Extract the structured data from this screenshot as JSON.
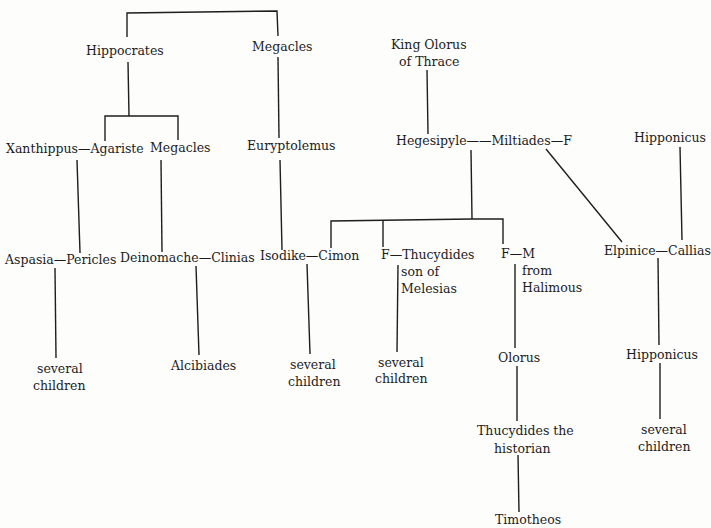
{
  "diagram": {
    "type": "family-tree",
    "nodes": {
      "hippocrates": "Hippocrates",
      "megacles_top": "Megacles",
      "king_olorus_1": "King Olorus",
      "king_olorus_2": "of Thrace",
      "xanthippus_agariste": "Xanthippus—Agariste",
      "megacles_mid": "Megacles",
      "euryptolemus": "Euryptolemus",
      "hegesipyle_miltiades": "Hegesipyle——Miltiades—F",
      "hipponicus_top": "Hipponicus",
      "aspasia_pericles": "Aspasia—Pericles",
      "deinomache_clinias": "Deinomache—Clinias",
      "isodike_cimon": "Isodike—Cimon",
      "f_thucydides": "F—Thucydides",
      "son_of": "son of",
      "melesias": "Melesias",
      "f_m": "F—M",
      "from": "from",
      "halimous": "Halimous",
      "elpinice_callias": "Elpinice—Callias",
      "several_1a": "several",
      "children_1b": "children",
      "alcibiades": "Alcibiades",
      "several_2a": "several",
      "children_2b": "children",
      "several_3a": "several",
      "children_3b": "children",
      "olorus": "Olorus",
      "hipponicus_bottom": "Hipponicus",
      "thucydides_hist_1": "Thucydides the",
      "thucydides_hist_2": "historian",
      "several_4a": "several",
      "children_4b": "children",
      "timotheos": "Timotheos"
    }
  }
}
